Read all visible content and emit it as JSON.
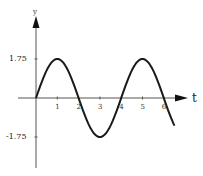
{
  "chart_data": {
    "type": "line",
    "title": "",
    "xlabel": "t",
    "ylabel": "y",
    "x_ticks": [
      "1",
      "2",
      "3",
      "4",
      "5",
      "6"
    ],
    "y_ticks": [
      "1.75",
      "-1.75"
    ],
    "xlim": [
      0,
      6.5
    ],
    "ylim": [
      -3.5,
      3.5
    ],
    "grid": false,
    "function": "y = 1.75 sin(pi t / 2)",
    "series": [
      {
        "name": "y(t)",
        "x": [
          0,
          0.5,
          1,
          1.5,
          2,
          2.5,
          3,
          3.5,
          4,
          4.5,
          5,
          5.5,
          6,
          6.5
        ],
        "values": [
          0,
          1.24,
          1.75,
          1.24,
          0,
          -1.24,
          -1.75,
          -1.24,
          0,
          1.24,
          1.75,
          1.24,
          0,
          -1.24
        ]
      }
    ],
    "colors": {
      "curve": "#1a1a1a",
      "axis": "#555555",
      "background": "#ffffff"
    }
  }
}
